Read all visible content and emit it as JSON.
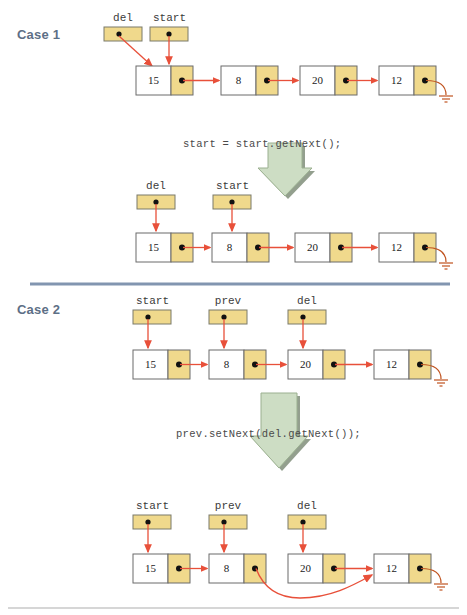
{
  "figure": {
    "background": "#ffffff",
    "colors": {
      "case_label": "#5d6f86",
      "divider": "#8295b0",
      "node_pointer_cell": "#f0d98c",
      "node_data_cell": "#ffffff",
      "node_border": "#6b6b6b",
      "link_arrow": "#e8503a",
      "block_arrow_fill": "#cdddc4",
      "block_arrow_edge": "#9bb090",
      "block_arrow_shadow": "#6f7f68",
      "code_text": "#4a4a4a",
      "bottom_rule": "#c9c9c9"
    }
  },
  "cases": [
    {
      "id": "case-1",
      "label": "Case 1",
      "code": "start = start.getNext();",
      "before": {
        "pointers": [
          {
            "name": "del",
            "targets": "15"
          },
          {
            "name": "start",
            "targets": "15"
          }
        ],
        "nodes": [
          {
            "value": "15"
          },
          {
            "value": "8"
          },
          {
            "value": "20"
          },
          {
            "value": "12"
          }
        ],
        "tail": "ground"
      },
      "after": {
        "pointers": [
          {
            "name": "del",
            "targets": "15"
          },
          {
            "name": "start",
            "targets": "8"
          }
        ],
        "nodes": [
          {
            "value": "15"
          },
          {
            "value": "8"
          },
          {
            "value": "20"
          },
          {
            "value": "12"
          }
        ],
        "tail": "ground"
      }
    },
    {
      "id": "case-2",
      "label": "Case 2",
      "code": "prev.setNext(del.getNext());",
      "before": {
        "pointers": [
          {
            "name": "start",
            "targets": "15"
          },
          {
            "name": "prev",
            "targets": "8"
          },
          {
            "name": "del",
            "targets": "20"
          }
        ],
        "nodes": [
          {
            "value": "15"
          },
          {
            "value": "8"
          },
          {
            "value": "20"
          },
          {
            "value": "12"
          }
        ],
        "tail": "ground"
      },
      "after": {
        "pointers": [
          {
            "name": "start",
            "targets": "15"
          },
          {
            "name": "prev",
            "targets": "8"
          },
          {
            "name": "del",
            "targets": "20"
          }
        ],
        "nodes": [
          {
            "value": "15"
          },
          {
            "value": "8"
          },
          {
            "value": "20"
          },
          {
            "value": "12"
          }
        ],
        "bypass": {
          "from": "8",
          "to": "12"
        },
        "tail": "ground"
      }
    }
  ],
  "labels": {
    "case1": "Case 1",
    "case2": "Case 2",
    "code1": "start = start.getNext();",
    "code2": "prev.setNext(del.getNext());",
    "c1_before_p0": "del",
    "c1_before_p1": "start",
    "c1_after_p0": "del",
    "c1_after_p1": "start",
    "c2_before_p0": "start",
    "c2_before_p1": "prev",
    "c2_before_p2": "del",
    "c2_after_p0": "start",
    "c2_after_p1": "prev",
    "c2_after_p2": "del",
    "n15": "15",
    "n8": "8",
    "n20": "20",
    "n12": "12"
  }
}
